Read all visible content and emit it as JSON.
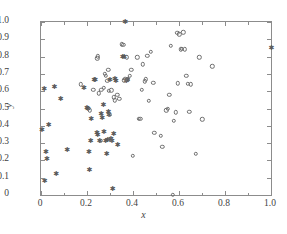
{
  "axes": {
    "x_title": "x",
    "y_title": "y",
    "x_tick_labels": [
      "0",
      "0.2",
      "0.4",
      "0.6",
      "0.8",
      "1.0"
    ],
    "y_tick_labels": [
      "0",
      "0.1",
      "0.2",
      "0.3",
      "0.4",
      "0.5",
      "0.6",
      "0.7",
      "0.8",
      "0.9",
      "1.0"
    ]
  },
  "caption": "",
  "colors": {
    "frame": "#8c8c8c",
    "circle_marker": "#6e6e6e",
    "star_marker": "#5a5a5a",
    "text": "#3f3f3f",
    "background": "#ffffff"
  },
  "chart_data": {
    "type": "scatter",
    "title": "",
    "xlabel": "x",
    "ylabel": "y",
    "xlim": [
      0,
      1
    ],
    "ylim": [
      0,
      1
    ],
    "grid": false,
    "legend": "none",
    "x_ticks": [
      0,
      0.2,
      0.4,
      0.6,
      0.8,
      1.0
    ],
    "x_minor_ticks": [
      0.1,
      0.3,
      0.5,
      0.7,
      0.9
    ],
    "y_ticks": [
      0,
      0.1,
      0.2,
      0.3,
      0.4,
      0.5,
      0.6,
      0.7,
      0.8,
      0.9,
      1.0
    ],
    "series": [
      {
        "name": "filled-star-class",
        "marker": "star",
        "filled": true,
        "points": [
          [
            0.0,
            0.378
          ],
          [
            0.01,
            0.615
          ],
          [
            0.012,
            0.08
          ],
          [
            0.018,
            0.25
          ],
          [
            0.022,
            0.207
          ],
          [
            0.03,
            0.405
          ],
          [
            0.055,
            0.622
          ],
          [
            0.062,
            0.12
          ],
          [
            0.082,
            0.556
          ],
          [
            0.11,
            0.263
          ],
          [
            0.183,
            0.62
          ],
          [
            0.196,
            0.505
          ],
          [
            0.2,
            0.497
          ],
          [
            0.205,
            0.251
          ],
          [
            0.207,
            0.145
          ],
          [
            0.212,
            0.31
          ],
          [
            0.215,
            0.437
          ],
          [
            0.228,
            0.667
          ],
          [
            0.232,
            0.663
          ],
          [
            0.24,
            0.357
          ],
          [
            0.243,
            0.345
          ],
          [
            0.252,
            0.312
          ],
          [
            0.258,
            0.47
          ],
          [
            0.262,
            0.445
          ],
          [
            0.268,
            0.523
          ],
          [
            0.27,
            0.363
          ],
          [
            0.278,
            0.313
          ],
          [
            0.282,
            0.238
          ],
          [
            0.286,
            0.318
          ],
          [
            0.29,
            0.478
          ],
          [
            0.292,
            0.462
          ],
          [
            0.296,
            0.665
          ],
          [
            0.3,
            0.325
          ],
          [
            0.305,
            0.315
          ],
          [
            0.308,
            0.035
          ],
          [
            0.312,
            0.352
          ],
          [
            0.318,
            0.668
          ],
          [
            0.322,
            0.66
          ],
          [
            0.33,
            0.289
          ],
          [
            0.352,
            0.797
          ],
          [
            0.358,
            0.8
          ],
          [
            0.362,
            1.0
          ],
          [
            0.368,
            0.658
          ],
          [
            0.372,
            0.665
          ],
          [
            0.998,
            0.852
          ]
        ]
      },
      {
        "name": "open-circle-class",
        "marker": "circle",
        "filled": false,
        "points": [
          [
            0.172,
            0.64
          ],
          [
            0.212,
            0.49
          ],
          [
            0.228,
            0.607
          ],
          [
            0.245,
            0.79
          ],
          [
            0.248,
            0.802
          ],
          [
            0.252,
            0.588
          ],
          [
            0.258,
            0.312
          ],
          [
            0.262,
            0.608
          ],
          [
            0.272,
            0.62
          ],
          [
            0.278,
            0.7
          ],
          [
            0.282,
            0.688
          ],
          [
            0.288,
            0.66
          ],
          [
            0.292,
            0.722
          ],
          [
            0.296,
            0.602
          ],
          [
            0.3,
            0.463
          ],
          [
            0.302,
            0.318
          ],
          [
            0.305,
            0.605
          ],
          [
            0.316,
            0.565
          ],
          [
            0.322,
            0.548
          ],
          [
            0.332,
            0.578
          ],
          [
            0.34,
            0.555
          ],
          [
            0.352,
            0.872
          ],
          [
            0.358,
            0.868
          ],
          [
            0.362,
            0.663
          ],
          [
            0.366,
            0.672
          ],
          [
            0.372,
            0.796
          ],
          [
            0.378,
            0.668
          ],
          [
            0.385,
            0.688
          ],
          [
            0.392,
            0.725
          ],
          [
            0.4,
            0.228
          ],
          [
            0.418,
            0.797
          ],
          [
            0.425,
            0.442
          ],
          [
            0.432,
            0.44
          ],
          [
            0.438,
            0.608
          ],
          [
            0.442,
            0.756
          ],
          [
            0.452,
            0.658
          ],
          [
            0.455,
            0.668
          ],
          [
            0.462,
            0.805
          ],
          [
            0.47,
            0.545
          ],
          [
            0.478,
            0.826
          ],
          [
            0.488,
            0.65
          ],
          [
            0.492,
            0.358
          ],
          [
            0.52,
            0.343
          ],
          [
            0.528,
            0.278
          ],
          [
            0.545,
            0.49
          ],
          [
            0.552,
            0.498
          ],
          [
            0.558,
            0.578
          ],
          [
            0.565,
            0.862
          ],
          [
            0.572,
            0.0
          ],
          [
            0.578,
            0.428
          ],
          [
            0.585,
            0.478
          ],
          [
            0.592,
            0.938
          ],
          [
            0.596,
            0.645
          ],
          [
            0.602,
            0.93
          ],
          [
            0.608,
            0.843
          ],
          [
            0.612,
            0.845
          ],
          [
            0.618,
            0.94
          ],
          [
            0.625,
            0.842
          ],
          [
            0.632,
            0.69
          ],
          [
            0.638,
            0.643
          ],
          [
            0.645,
            0.482
          ],
          [
            0.652,
            0.64
          ],
          [
            0.672,
            0.238
          ],
          [
            0.688,
            0.797
          ],
          [
            0.702,
            0.437
          ],
          [
            0.745,
            0.745
          ]
        ]
      }
    ]
  }
}
